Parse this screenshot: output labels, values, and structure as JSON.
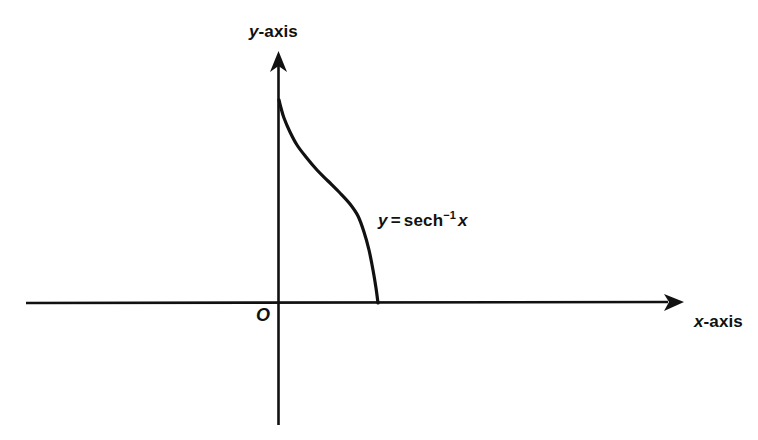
{
  "figure": {
    "background_color": "#ffffff",
    "ink_color": "#111111"
  },
  "labels": {
    "y_axis_var": "y",
    "y_axis_suffix": "-axis",
    "x_axis_var": "x",
    "x_axis_suffix": "-axis",
    "origin": "O"
  },
  "equation": {
    "lhs": "y",
    "equals": "=",
    "function": "sech",
    "exponent": "−1",
    "argument": "x",
    "full_text": "y = sech−1 x"
  },
  "chart_data": {
    "type": "line",
    "title": "",
    "xlabel": "x-axis",
    "ylabel": "y-axis",
    "annotations": [
      {
        "text": "y = sech−1 x",
        "x": 0.86,
        "y": 0.62
      },
      {
        "text": "O",
        "x": 0.0,
        "y": 0.0
      }
    ],
    "grid": false,
    "legend": null,
    "axes": {
      "x_arrow": true,
      "y_arrow": true,
      "x_range_px": [
        26,
        683
      ],
      "y_range_px": [
        52,
        425
      ],
      "origin_px": [
        278,
        303
      ]
    },
    "series": [
      {
        "name": "y = sech^-1 x",
        "x": [
          0.0,
          0.02,
          0.05,
          0.1,
          0.16,
          0.24,
          0.34,
          0.45,
          0.58,
          0.7,
          0.8,
          0.88,
          0.94,
          0.975,
          0.995,
          1.0
        ],
        "y": [
          2.1,
          2.0,
          1.82,
          1.56,
          1.35,
          1.15,
          0.96,
          0.8,
          0.64,
          0.51,
          0.39,
          0.28,
          0.19,
          0.12,
          0.05,
          0.0
        ],
        "px": [
          [
            279,
            100
          ],
          [
            281,
            108
          ],
          [
            284,
            118
          ],
          [
            290,
            132
          ],
          [
            297,
            145
          ],
          [
            306,
            157
          ],
          [
            317,
            170
          ],
          [
            328,
            181
          ],
          [
            340,
            193
          ],
          [
            350,
            204
          ],
          [
            358,
            216
          ],
          [
            364,
            232
          ],
          [
            369,
            250
          ],
          [
            373,
            270
          ],
          [
            376,
            288
          ],
          [
            378,
            303
          ]
        ],
        "color": "#111111",
        "line_width": 3.2
      }
    ]
  }
}
